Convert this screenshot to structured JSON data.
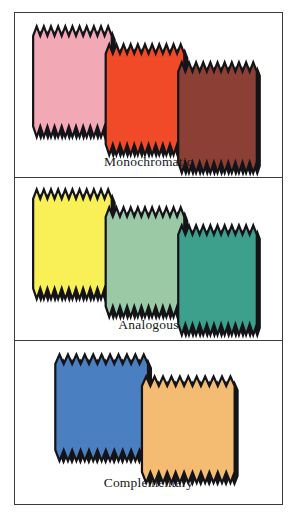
{
  "figure": {
    "background_color": "#ffffff",
    "frame_color": "#3b3b3b",
    "swatch_outline_color": "#141418",
    "shadow_color": "#141418"
  },
  "panels": [
    {
      "id": "monochromatic",
      "caption": "Monochromatic",
      "swatch_count": 3,
      "swatches": [
        {
          "name": "light-pink",
          "color": "#F2A8B5"
        },
        {
          "name": "red-orange",
          "color": "#F04A28"
        },
        {
          "name": "dark-brick",
          "color": "#8C4035"
        }
      ]
    },
    {
      "id": "analogous",
      "caption": "Analogous",
      "swatch_count": 3,
      "swatches": [
        {
          "name": "yellow",
          "color": "#F8F056"
        },
        {
          "name": "light-green",
          "color": "#9BC9A6"
        },
        {
          "name": "teal",
          "color": "#3CA08C"
        }
      ]
    },
    {
      "id": "complementary",
      "caption": "Complementary",
      "swatch_count": 2,
      "swatches": [
        {
          "name": "blue",
          "color": "#4A7FC1"
        },
        {
          "name": "light-orange",
          "color": "#F4BC72"
        }
      ]
    }
  ]
}
